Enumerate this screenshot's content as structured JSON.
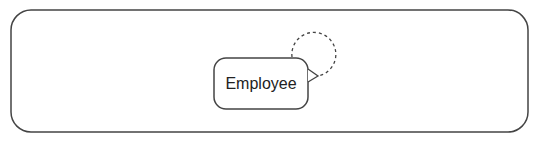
{
  "diagram": {
    "container": {
      "x": 11,
      "y": 10,
      "width": 517,
      "height": 122,
      "radius": 20,
      "stroke": "#444444"
    },
    "entities": [
      {
        "name": "Employee",
        "x": 214,
        "y": 58,
        "width": 94,
        "height": 51,
        "radius": 12,
        "stroke": "#444444"
      }
    ],
    "relationships": [
      {
        "type": "self-reference",
        "from": "Employee",
        "to": "Employee",
        "style": "dashed",
        "marker": "triangle",
        "stroke": "#444444"
      }
    ]
  }
}
